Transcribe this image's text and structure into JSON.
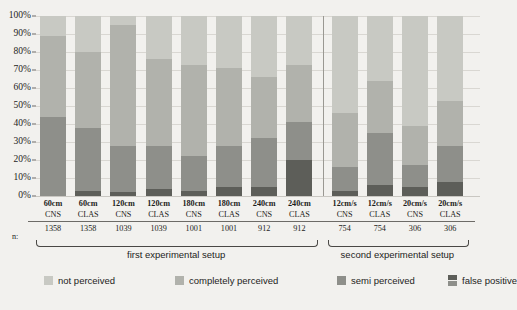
{
  "chart_data": {
    "type": "bar",
    "subtype": "stacked-percent",
    "title": "",
    "xlabel": "",
    "ylabel": "",
    "ylim": [
      0,
      100
    ],
    "grid": true,
    "legend_position": "bottom",
    "ytick_labels": [
      "100%",
      "90%",
      "80%",
      "70%",
      "60%",
      "50%",
      "40%",
      "30%",
      "20%",
      "10%",
      "0%"
    ],
    "ytick_values": [
      100,
      90,
      80,
      70,
      60,
      50,
      40,
      30,
      20,
      10,
      0
    ],
    "n_row_label": "n:",
    "categories": [
      {
        "distance": "60cm",
        "method": "CNS",
        "n": "1358"
      },
      {
        "distance": "60cm",
        "method": "CLAS",
        "n": "1358"
      },
      {
        "distance": "120cm",
        "method": "CNS",
        "n": "1039"
      },
      {
        "distance": "120cm",
        "method": "CLAS",
        "n": "1039"
      },
      {
        "distance": "180cm",
        "method": "CNS",
        "n": "1001"
      },
      {
        "distance": "180cm",
        "method": "CLAS",
        "n": "1001"
      },
      {
        "distance": "240cm",
        "method": "CNS",
        "n": "912"
      },
      {
        "distance": "240cm",
        "method": "CLAS",
        "n": "912"
      },
      {
        "distance": "12cm/s",
        "method": "CNS",
        "n": "754"
      },
      {
        "distance": "12cm/s",
        "method": "CLAS",
        "n": "754"
      },
      {
        "distance": "20cm/s",
        "method": "CNS",
        "n": "306"
      },
      {
        "distance": "20cm/s",
        "method": "CLAS",
        "n": "306"
      }
    ],
    "series": [
      {
        "name": "not perceived",
        "color": "#c8c9c3",
        "values": [
          11,
          20,
          5,
          24,
          27,
          29,
          34,
          27,
          54,
          36,
          61,
          47
        ]
      },
      {
        "name": "completely perceived",
        "color": "#b1b2ac",
        "values": [
          45,
          42,
          67,
          48,
          51,
          43,
          34,
          32,
          30,
          29,
          22,
          25
        ]
      },
      {
        "name": "semi perceived",
        "color": "#8e8f8a",
        "values": [
          44,
          35,
          26,
          24,
          19,
          23,
          27,
          21,
          13,
          29,
          12,
          20
        ]
      },
      {
        "name": "false positive",
        "color": "#5d5e59",
        "values": [
          0,
          3,
          2,
          4,
          3,
          5,
          5,
          20,
          3,
          6,
          5,
          8
        ]
      }
    ],
    "groups": [
      {
        "label": "first experimental setup",
        "from": 0,
        "to": 7
      },
      {
        "label": "second experimental setup",
        "from": 8,
        "to": 11
      }
    ]
  },
  "legend": {
    "items": [
      {
        "label": "not perceived",
        "icon": "legend-swatch-not-perceived"
      },
      {
        "label": "completely perceived",
        "icon": "legend-swatch-completely-perceived"
      },
      {
        "label": "semi perceived",
        "icon": "legend-swatch-semi-perceived"
      },
      {
        "label": "false positive",
        "icon": "legend-swatch-false-positive"
      }
    ]
  }
}
